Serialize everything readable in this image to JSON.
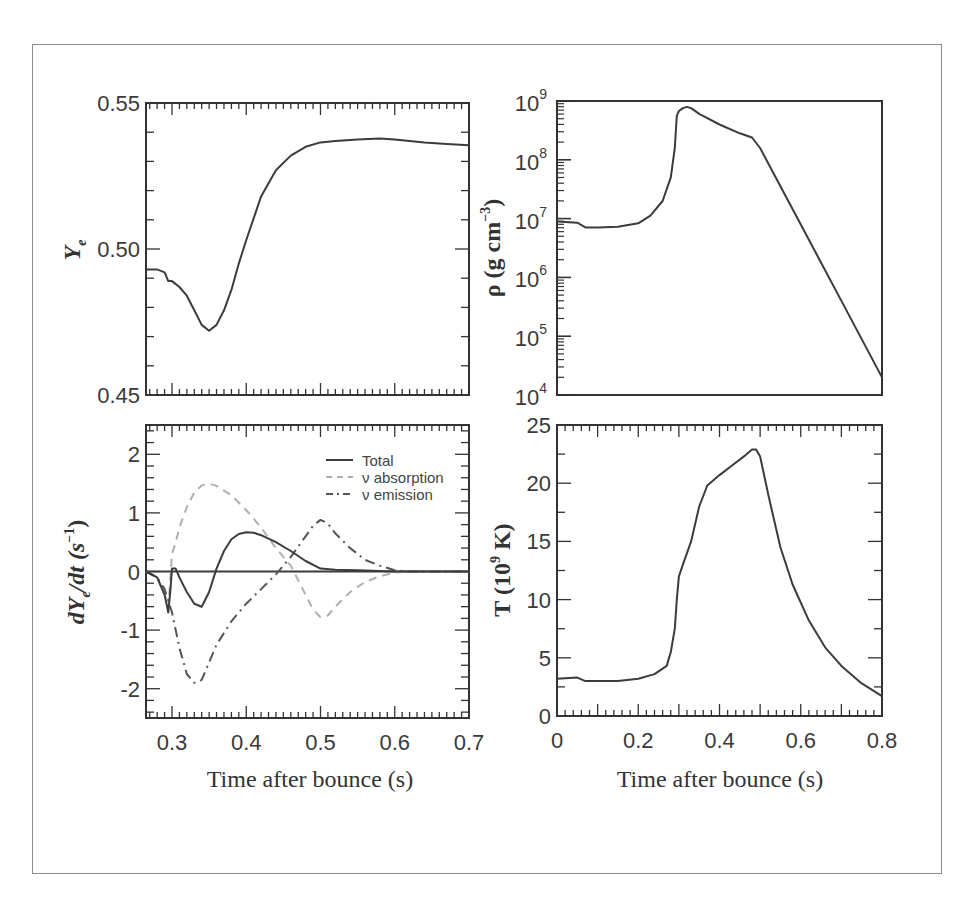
{
  "figure": {
    "panels": [
      "Ye",
      "rho",
      "dYedt",
      "T"
    ]
  },
  "chart_data": [
    {
      "id": "Ye",
      "type": "line",
      "title": "",
      "xlabel": "",
      "ylabel": "Y_e",
      "xlim": [
        0.265,
        0.7
      ],
      "ylim": [
        0.45,
        0.55
      ],
      "yticks": [
        "0.45",
        "0.50",
        "0.55"
      ],
      "ytick_values": [
        0.45,
        0.5,
        0.55
      ],
      "xticks_shared_with": "dYedt",
      "grid": false,
      "series": [
        {
          "name": "Ye",
          "x": [
            0.265,
            0.28,
            0.29,
            0.295,
            0.3,
            0.31,
            0.32,
            0.33,
            0.34,
            0.35,
            0.36,
            0.37,
            0.38,
            0.39,
            0.4,
            0.42,
            0.44,
            0.46,
            0.48,
            0.5,
            0.52,
            0.55,
            0.58,
            0.6,
            0.64,
            0.67,
            0.7
          ],
          "y": [
            0.493,
            0.493,
            0.492,
            0.489,
            0.489,
            0.487,
            0.484,
            0.479,
            0.474,
            0.472,
            0.474,
            0.479,
            0.486,
            0.495,
            0.503,
            0.518,
            0.527,
            0.532,
            0.535,
            0.5365,
            0.537,
            0.5375,
            0.5378,
            0.5375,
            0.5365,
            0.536,
            0.5355
          ]
        }
      ]
    },
    {
      "id": "rho",
      "type": "line",
      "yscale": "log",
      "xlabel": "",
      "ylabel": "ρ (g cm⁻³)",
      "xlim": [
        0,
        0.8
      ],
      "ylim": [
        10000.0,
        1000000000.0
      ],
      "yticks": [
        "10^4",
        "10^5",
        "10^6",
        "10^7",
        "10^8",
        "10^9"
      ],
      "ytick_exponents": [
        4,
        5,
        6,
        7,
        8,
        9
      ],
      "grid": false,
      "series": [
        {
          "name": "rho",
          "x": [
            0.0,
            0.05,
            0.07,
            0.1,
            0.15,
            0.2,
            0.23,
            0.26,
            0.28,
            0.29,
            0.295,
            0.3,
            0.31,
            0.32,
            0.33,
            0.35,
            0.4,
            0.45,
            0.48,
            0.5,
            0.55,
            0.6,
            0.65,
            0.7,
            0.75,
            0.8
          ],
          "log10_y": [
            6.95,
            6.93,
            6.85,
            6.85,
            6.86,
            6.92,
            7.05,
            7.3,
            7.7,
            8.2,
            8.75,
            8.83,
            8.88,
            8.9,
            8.88,
            8.78,
            8.6,
            8.45,
            8.38,
            8.2,
            7.55,
            6.9,
            6.25,
            5.6,
            4.95,
            4.3
          ]
        }
      ]
    },
    {
      "id": "dYedt",
      "type": "line",
      "xlabel": "Time after bounce (s)",
      "ylabel": "dY_e/dt (s⁻¹)",
      "xlim": [
        0.265,
        0.7
      ],
      "ylim": [
        -2.5,
        2.5
      ],
      "xticks": [
        "0.3",
        "0.4",
        "0.5",
        "0.6",
        "0.7"
      ],
      "xtick_values": [
        0.3,
        0.4,
        0.5,
        0.6,
        0.7
      ],
      "yticks": [
        "-2",
        "-1",
        "0",
        "1",
        "2"
      ],
      "ytick_values": [
        -2,
        -1,
        0,
        1,
        2
      ],
      "legend": {
        "position": "upper right",
        "entries": [
          "Total",
          "ν absorption",
          "ν emission"
        ]
      },
      "grid": false,
      "series": [
        {
          "name": "Total",
          "style": "solid",
          "x": [
            0.265,
            0.28,
            0.29,
            0.295,
            0.298,
            0.3,
            0.305,
            0.31,
            0.32,
            0.33,
            0.34,
            0.35,
            0.36,
            0.37,
            0.38,
            0.39,
            0.4,
            0.41,
            0.42,
            0.44,
            0.46,
            0.48,
            0.5,
            0.52,
            0.55,
            0.6,
            0.65,
            0.7
          ],
          "y": [
            0.0,
            -0.1,
            -0.4,
            -0.7,
            -0.3,
            0.05,
            0.05,
            -0.1,
            -0.35,
            -0.55,
            -0.6,
            -0.35,
            0.05,
            0.35,
            0.55,
            0.64,
            0.67,
            0.66,
            0.62,
            0.5,
            0.35,
            0.18,
            0.05,
            0.03,
            0.02,
            0.0,
            0.0,
            0.0
          ]
        },
        {
          "name": "ν absorption",
          "style": "dashed",
          "x": [
            0.265,
            0.28,
            0.29,
            0.295,
            0.3,
            0.305,
            0.31,
            0.32,
            0.33,
            0.34,
            0.35,
            0.36,
            0.38,
            0.4,
            0.42,
            0.44,
            0.46,
            0.47,
            0.48,
            0.49,
            0.5,
            0.51,
            0.52,
            0.54,
            0.56,
            0.58,
            0.6,
            0.62,
            0.65,
            0.7
          ],
          "y": [
            0.0,
            -0.1,
            -0.4,
            -0.6,
            0.3,
            0.5,
            0.75,
            1.1,
            1.35,
            1.47,
            1.5,
            1.46,
            1.3,
            1.05,
            0.75,
            0.4,
            0.1,
            -0.15,
            -0.4,
            -0.65,
            -0.78,
            -0.75,
            -0.6,
            -0.35,
            -0.18,
            -0.08,
            -0.02,
            0.0,
            0.0,
            0.0
          ]
        },
        {
          "name": "ν emission",
          "style": "dashdot",
          "x": [
            0.265,
            0.28,
            0.29,
            0.3,
            0.31,
            0.32,
            0.33,
            0.34,
            0.35,
            0.36,
            0.38,
            0.4,
            0.42,
            0.44,
            0.46,
            0.48,
            0.49,
            0.5,
            0.51,
            0.52,
            0.54,
            0.56,
            0.58,
            0.6,
            0.62,
            0.65,
            0.7
          ],
          "y": [
            0.0,
            -0.1,
            -0.3,
            -0.7,
            -1.3,
            -1.75,
            -1.9,
            -1.85,
            -1.55,
            -1.25,
            -0.85,
            -0.55,
            -0.3,
            -0.05,
            0.25,
            0.6,
            0.78,
            0.88,
            0.82,
            0.65,
            0.4,
            0.2,
            0.1,
            0.02,
            0.0,
            0.0,
            0.0
          ]
        }
      ]
    },
    {
      "id": "T",
      "type": "line",
      "xlabel": "Time after bounce (s)",
      "ylabel": "T (10⁹ K)",
      "xlim": [
        0,
        0.8
      ],
      "ylim": [
        0,
        25
      ],
      "xticks": [
        "0",
        "0.2",
        "0.4",
        "0.6",
        "0.8"
      ],
      "xtick_values": [
        0,
        0.2,
        0.4,
        0.6,
        0.8
      ],
      "yticks": [
        "0",
        "5",
        "10",
        "15",
        "20",
        "25"
      ],
      "ytick_values": [
        0,
        5,
        10,
        15,
        20,
        25
      ],
      "grid": false,
      "series": [
        {
          "name": "T",
          "x": [
            0.0,
            0.05,
            0.07,
            0.1,
            0.15,
            0.2,
            0.24,
            0.27,
            0.28,
            0.29,
            0.295,
            0.3,
            0.31,
            0.33,
            0.35,
            0.37,
            0.4,
            0.43,
            0.46,
            0.48,
            0.49,
            0.5,
            0.52,
            0.55,
            0.58,
            0.62,
            0.66,
            0.7,
            0.75,
            0.8
          ],
          "y": [
            3.2,
            3.3,
            3.0,
            3.0,
            3.0,
            3.2,
            3.6,
            4.3,
            5.5,
            7.5,
            10,
            12,
            13,
            15,
            18,
            19.8,
            20.7,
            21.5,
            22.3,
            22.9,
            22.9,
            22.3,
            19,
            14.5,
            11.3,
            8.2,
            5.9,
            4.3,
            2.8,
            1.7
          ]
        }
      ]
    }
  ],
  "labels": {
    "ye_ylabel": "Y",
    "ye_ylabel_sub": "e",
    "rho_ylabel": "ρ (g cm",
    "rho_ylabel_sup": "−3",
    "rho_ylabel_end": ")",
    "dyedt_ylabel_a": "dY",
    "dyedt_ylabel_sub": "e",
    "dyedt_ylabel_b": "/dt (s",
    "dyedt_ylabel_sup": "−1",
    "dyedt_ylabel_end": ")",
    "t_ylabel_a": "T (10",
    "t_ylabel_sup": "9",
    "t_ylabel_b": " K)",
    "xlabel_left": "Time after bounce (s)",
    "xlabel_right": "Time after bounce (s)",
    "legend_total": "Total",
    "legend_absorption": "ν absorption",
    "legend_emission": "ν emission"
  },
  "colors": {
    "line": "#3c3c3c",
    "absorption": "#b0b0b0",
    "emission": "#555555",
    "axes": "#333333",
    "frame": "#8a8a8a"
  }
}
